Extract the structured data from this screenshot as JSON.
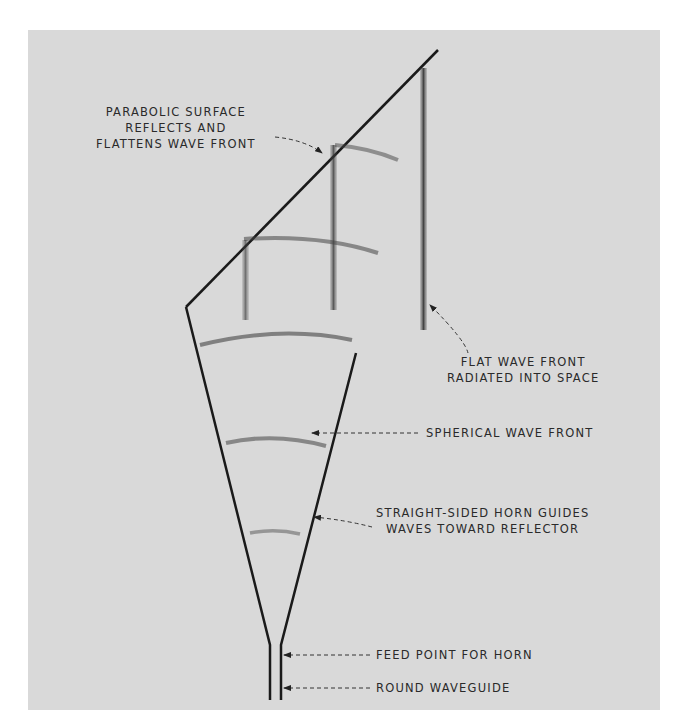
{
  "figure": {
    "background_color": "#d9d9d9",
    "line_color": "#1a1a1a",
    "labels": {
      "parabolic_surface": [
        "PARABOLIC SURFACE",
        "REFLECTS AND",
        "FLATTENS WAVE FRONT"
      ],
      "flat_wave_front": [
        "FLAT WAVE FRONT",
        "RADIATED INTO SPACE"
      ],
      "spherical_wave_front": "SPHERICAL WAVE FRONT",
      "horn_guides": [
        "STRAIGHT-SIDED HORN GUIDES",
        "WAVES TOWARD REFLECTOR"
      ],
      "feed_point": "FEED POINT FOR HORN",
      "round_waveguide": "ROUND WAVEGUIDE"
    }
  }
}
